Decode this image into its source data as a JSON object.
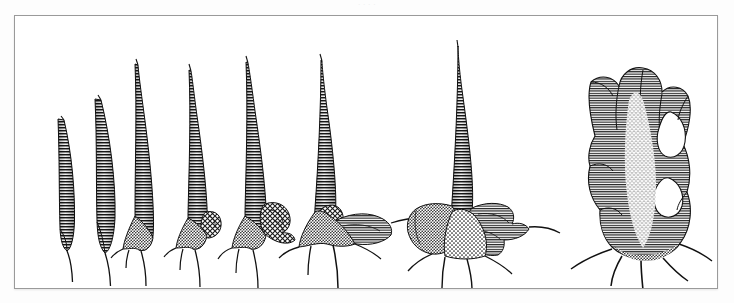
{
  "plate": {
    "caption_remnant": "·  ·            ·     ·",
    "frame": {
      "x": 14,
      "y": 15,
      "width": 704,
      "height": 274,
      "border_color": "#9a9a9a"
    },
    "background_color": "#ffffff",
    "page_color": "#fdfdfd",
    "ink_color": "#1a1a1a",
    "illustration_style": "pen-and-ink hatching and stipple",
    "subject": "morphological series of spine-like pronotal structures",
    "specimen_count": 8
  },
  "figure_data": {
    "type": "illustration-series",
    "title": "Morphological transformation series",
    "orientation": "left-to-right, simple to elaborate",
    "specimens": [
      {
        "index": 1,
        "label": "specimen-1",
        "cx": 55,
        "tip_y": 118,
        "base_y": 242,
        "tail_y": 268,
        "height": 124,
        "max_width": 17,
        "complexity": "simple narrow blade",
        "lateral_knob": false,
        "basal_spines": 0,
        "fenestrations": 0,
        "curvature": "slight rightward lean"
      },
      {
        "index": 2,
        "label": "specimen-2",
        "cx": 95,
        "tip_y": 98,
        "base_y": 243,
        "tail_y": 272,
        "height": 145,
        "max_width": 20,
        "complexity": "narrow blade, broader base",
        "lateral_knob": false,
        "basal_spines": 0,
        "fenestrations": 0,
        "curvature": "slight rightward lean"
      },
      {
        "index": 3,
        "label": "specimen-3",
        "cx": 135,
        "tip_y": 62,
        "base_y": 240,
        "tail_y": 272,
        "height": 178,
        "max_width": 26,
        "complexity": "tall spine with basal flare",
        "lateral_knob": false,
        "basal_spines": 2,
        "fenestrations": 0,
        "curvature": "straight"
      },
      {
        "index": 4,
        "label": "specimen-4",
        "cx": 190,
        "tip_y": 68,
        "base_y": 238,
        "tail_y": 270,
        "height": 170,
        "max_width": 28,
        "complexity": "spine with small lateral knob",
        "lateral_knob": true,
        "basal_spines": 2,
        "fenestrations": 0,
        "curvature": "straight"
      },
      {
        "index": 5,
        "label": "specimen-5",
        "cx": 247,
        "tip_y": 60,
        "base_y": 238,
        "tail_y": 272,
        "height": 178,
        "max_width": 42,
        "complexity": "spine with enlarged lateral lobe",
        "lateral_knob": true,
        "basal_spines": 2,
        "fenestrations": 0,
        "curvature": "straight"
      },
      {
        "index": 6,
        "label": "specimen-6",
        "cx": 320,
        "tip_y": 58,
        "base_y": 240,
        "tail_y": 276,
        "height": 182,
        "max_width": 86,
        "complexity": "spine with expanded lateral wing and ventral spine",
        "lateral_knob": true,
        "basal_spines": 3,
        "fenestrations": 0,
        "curvature": "straight"
      },
      {
        "index": 7,
        "label": "specimen-7",
        "cx": 455,
        "tip_y": 44,
        "base_y": 245,
        "tail_y": 278,
        "height": 201,
        "max_width": 98,
        "complexity": "tall spine on broad multi-lobed base",
        "lateral_knob": true,
        "basal_spines": 4,
        "fenestrations": 0,
        "curvature": "straight"
      },
      {
        "index": 8,
        "label": "specimen-8",
        "cx": 625,
        "tip_y": 48,
        "base_y": 250,
        "tail_y": 282,
        "height": 202,
        "max_width": 112,
        "complexity": "broad fenestrated multi-lobed crest",
        "lateral_knob": true,
        "basal_spines": 5,
        "fenestrations": 2,
        "curvature": "straight"
      }
    ]
  }
}
